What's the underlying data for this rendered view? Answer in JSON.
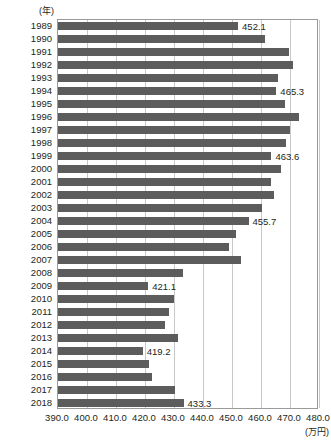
{
  "chart_data": {
    "type": "bar",
    "orientation": "horizontal",
    "title": "",
    "xlabel": "(万円)",
    "ylabel": "(年)",
    "xlim": [
      390.0,
      480.0
    ],
    "xticks": [
      390.0,
      400.0,
      410.0,
      420.0,
      430.0,
      440.0,
      450.0,
      460.0,
      470.0,
      480.0
    ],
    "xtick_labels": [
      "390.0",
      "400.0",
      "410.0",
      "420.0",
      "430.0",
      "440.0",
      "450.0",
      "460.0",
      "470.0",
      "480.0"
    ],
    "grid": true,
    "legend": false,
    "bar_color": "#5c5c5c",
    "categories": [
      "1989",
      "1990",
      "1991",
      "1992",
      "1993",
      "1994",
      "1995",
      "1996",
      "1997",
      "1998",
      "1999",
      "2000",
      "2001",
      "2002",
      "2003",
      "2004",
      "2005",
      "2006",
      "2007",
      "2008",
      "2009",
      "2010",
      "2011",
      "2012",
      "2013",
      "2014",
      "2015",
      "2016",
      "2017",
      "2018"
    ],
    "values": [
      452.1,
      461.5,
      469.8,
      471.2,
      466.0,
      465.3,
      468.2,
      473.2,
      470.1,
      468.5,
      463.6,
      466.8,
      463.4,
      464.6,
      460.5,
      455.7,
      451.4,
      448.9,
      453.2,
      433.0,
      421.1,
      430.0,
      428.3,
      427.0,
      431.4,
      419.2,
      421.3,
      422.3,
      430.4,
      433.3
    ],
    "data_labels": [
      {
        "category": "1989",
        "value": 452.1,
        "text": "452.1"
      },
      {
        "category": "1994",
        "value": 465.3,
        "text": "465.3"
      },
      {
        "category": "1999",
        "value": 463.6,
        "text": "463.6"
      },
      {
        "category": "2004",
        "value": 455.7,
        "text": "455.7"
      },
      {
        "category": "2009",
        "value": 421.1,
        "text": "421.1"
      },
      {
        "category": "2014",
        "value": 419.2,
        "text": "419.2"
      },
      {
        "category": "2018",
        "value": 433.3,
        "text": "433.3"
      }
    ]
  }
}
